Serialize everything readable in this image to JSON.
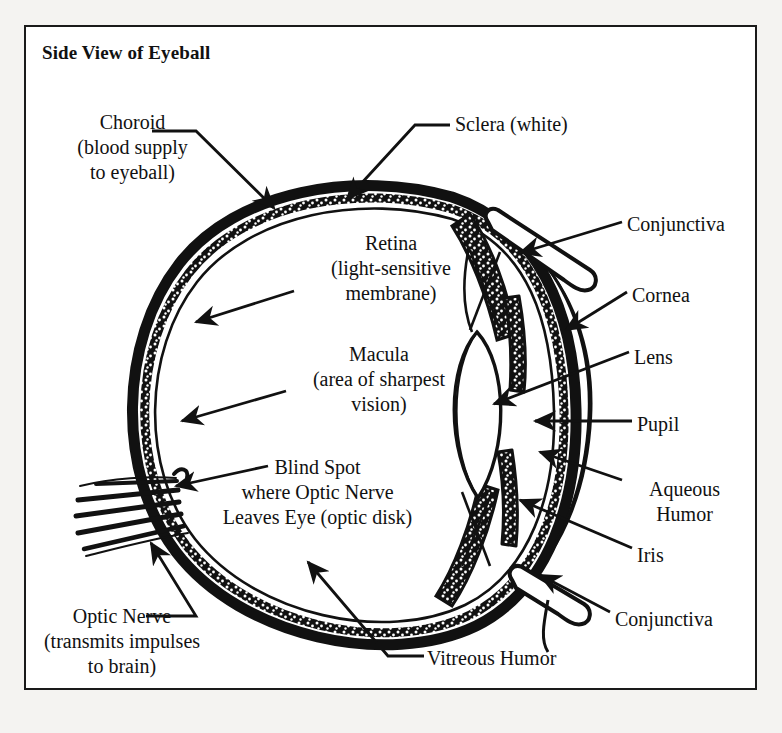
{
  "figure": {
    "title": "Side View of Eyeball",
    "frame_color": "#1a1a1a",
    "page_background": "#f4f3f1",
    "panel_background": "#ffffff",
    "ink_color": "#111111"
  },
  "labels": {
    "choroid": {
      "text": "Choroid\n(blood supply\nto eyeball)",
      "x": 45,
      "y": 110,
      "w": 175,
      "align": "center"
    },
    "sclera": {
      "text": "Sclera (white)",
      "x": 455,
      "y": 112,
      "w": 160,
      "align": "left"
    },
    "retina": {
      "text": "Retina\n(light-sensitive\nmembrane)",
      "x": 296,
      "y": 231,
      "w": 190,
      "align": "center"
    },
    "macula": {
      "text": "Macula\n(area of sharpest\nvision)",
      "x": 284,
      "y": 342,
      "w": 190,
      "align": "center"
    },
    "blind_spot": {
      "text": "Blind Spot\nwhere Optic Nerve\nLeaves Eye (optic disk)",
      "x": 200,
      "y": 455,
      "w": 235,
      "align": "center"
    },
    "optic_nerve": {
      "text": "Optic Nerve\n(transmits impulses\nto brain)",
      "x": 22,
      "y": 604,
      "w": 200,
      "align": "center"
    },
    "vitreous": {
      "text": "Vitreous Humor",
      "x": 427,
      "y": 646,
      "w": 160,
      "align": "left"
    },
    "conjunctiva_top": {
      "text": "Conjunctiva",
      "x": 627,
      "y": 212,
      "w": 130,
      "align": "left"
    },
    "cornea": {
      "text": "Cornea",
      "x": 632,
      "y": 283,
      "w": 100,
      "align": "left"
    },
    "lens": {
      "text": "Lens",
      "x": 634,
      "y": 345,
      "w": 80,
      "align": "left"
    },
    "pupil": {
      "text": "Pupil",
      "x": 637,
      "y": 412,
      "w": 80,
      "align": "left"
    },
    "aqueous_humor": {
      "text": "Aqueous\nHumor",
      "x": 627,
      "y": 477,
      "w": 115,
      "align": "center"
    },
    "iris": {
      "text": "Iris",
      "x": 637,
      "y": 543,
      "w": 70,
      "align": "left"
    },
    "conjunctiva_bottom": {
      "text": "Conjunctiva",
      "x": 615,
      "y": 607,
      "w": 130,
      "align": "left"
    }
  },
  "anatomy_parts": [
    "sclera-outer-wall",
    "choroid-stippled-layer",
    "retina-inner-line",
    "optic-nerve-bundle",
    "lens",
    "iris-upper",
    "iris-lower",
    "cornea-arc",
    "conjunctiva-upper-flap",
    "conjunctiva-lower-flap",
    "ciliary-body-upper",
    "ciliary-body-lower",
    "vitreous-chamber",
    "anterior-chamber"
  ]
}
